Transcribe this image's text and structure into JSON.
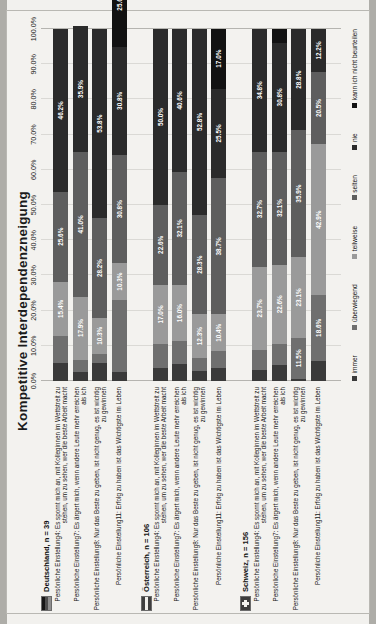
{
  "chart_data": {
    "type": "bar",
    "orientation": "horizontal-stacked",
    "title": "Kompetitive Interdependenzneigung",
    "xlabel": "",
    "ylabel": "",
    "xlim": [
      0,
      100
    ],
    "grid": true,
    "legend_position": "bottom",
    "axis_ticks": [
      "0.0%",
      "10.0%",
      "20.0%",
      "30.0%",
      "40.0%",
      "50.0%",
      "60.0%",
      "70.0%",
      "80.0%",
      "90.0%",
      "100.0%"
    ],
    "series": [
      {
        "name": "immer",
        "color": "#3a3a3a"
      },
      {
        "name": "überwiegend",
        "color": "#6f6f6f"
      },
      {
        "name": "teilweise",
        "color": "#9a9a9a"
      },
      {
        "name": "selten",
        "color": "#5e5e5e"
      },
      {
        "name": "nie",
        "color": "#2b2b2b"
      },
      {
        "name": "kann ich nicht beurteilen",
        "color": "#121212"
      }
    ],
    "groups": [
      {
        "name": "Deutschland, n = 39",
        "flag": "de",
        "rows": [
          {
            "label": "Persönliche Einstellung4: Es spornt mich an, mit Kolleginnen im Wettstreit zu stehen, um zu sehen, wer die beste Arbeit macht",
            "values": [
              5.1,
              7.7,
              15.4,
              25.6,
              46.2,
              0.0
            ],
            "labels": [
              "",
              "",
              "15.4%",
              "25.6%",
              "46.2%",
              ""
            ]
          },
          {
            "label": "Persönliche Einstellung7: Es ärgert mich, wenn andere Leute mehr erreichen als ich",
            "values": [
              2.6,
              3.5,
              17.9,
              41.0,
              35.9,
              0.0
            ],
            "labels": [
              "",
              "",
              "17.9%",
              "41.0%",
              "35.9%",
              ""
            ]
          },
          {
            "label": "Persönliche Einstellung8: Nur das Beste zu geben, ist nicht genug, es ist wichtig zu gewinnen",
            "values": [
              5.1,
              2.6,
              10.3,
              28.2,
              53.8,
              0.0
            ],
            "labels": [
              "",
              "",
              "10.3%",
              "28.2%",
              "53.8%",
              ""
            ]
          },
          {
            "label": "Persönliche Einstellung11: Erfolg zu haben ist das Wichtigste im Leben",
            "values": [
              2.6,
              20.5,
              10.3,
              30.8,
              30.8,
              25.6
            ],
            "labels": [
              "",
              "",
              "10.3%",
              "30.8%",
              "30.8%",
              "25.6%"
            ]
          }
        ]
      },
      {
        "name": "Österreich, n = 106",
        "flag": "at",
        "rows": [
          {
            "label": "Persönliche Einstellung4: Es spornt mich an, mit Kolleginnen im Wettstreit zu stehen, um zu sehen, wer die beste Arbeit macht",
            "values": [
              3.8,
              6.6,
              17.0,
              22.6,
              50.0,
              0.0
            ],
            "labels": [
              "",
              "",
              "17.0%",
              "22.6%",
              "50.0%",
              ""
            ]
          },
          {
            "label": "Persönliche Einstellung7: Es ärgert mich, wenn andere Leute mehr erreichen als ich",
            "values": [
              4.7,
              6.6,
              16.0,
              32.1,
              40.6,
              0.0
            ],
            "labels": [
              "",
              "",
              "16.0%",
              "32.1%",
              "40.6%",
              ""
            ]
          },
          {
            "label": "Persönliche Einstellung8: Nur das Beste zu geben, ist nicht genug, es ist wichtig zu gewinnen",
            "values": [
              2.8,
              3.8,
              12.3,
              28.3,
              52.8,
              0.0
            ],
            "labels": [
              "",
              "",
              "12.3%",
              "28.3%",
              "52.8%",
              ""
            ]
          },
          {
            "label": "Persönliche Einstellung11: Erfolg zu haben ist das Wichtigste im Leben",
            "values": [
              3.8,
              4.7,
              10.4,
              38.7,
              25.5,
              17.0
            ],
            "labels": [
              "",
              "",
              "10.4%",
              "38.7%",
              "25.5%",
              "17.0%"
            ]
          }
        ]
      },
      {
        "name": "Schweiz, n = 156",
        "flag": "ch",
        "rows": [
          {
            "label": "Persönliche Einstellung4: Es spornt mich an, mit Kolleginnen im Wettstreit zu stehen, um zu sehen, wer die beste Arbeit macht",
            "values": [
              3.2,
              5.6,
              23.7,
              32.7,
              34.8,
              0.0
            ],
            "labels": [
              "",
              "",
              "23.7%",
              "32.7%",
              "34.8%",
              ""
            ]
          },
          {
            "label": "Persönliche Einstellung7: Es ärgert mich, wenn andere Leute mehr erreichen als ich",
            "values": [
              4.5,
              6.0,
              22.6,
              32.1,
              30.8,
              4.0
            ],
            "labels": [
              "",
              "",
              "22.6%",
              "32.1%",
              "30.8%",
              ""
            ]
          },
          {
            "label": "Persönliche Einstellung8: Nur das Beste zu geben, ist nicht genug, es ist wichtig zu gewinnen",
            "values": [
              0.7,
              11.5,
              23.1,
              35.9,
              28.8,
              0.0
            ],
            "labels": [
              "",
              "11.5%",
              "23.1%",
              "35.9%",
              "28.8%",
              ""
            ]
          },
          {
            "label": "Persönliche Einstellung11: Erfolg zu haben ist das Wichtigste im Leben",
            "values": [
              5.8,
              18.6,
              42.9,
              20.5,
              12.2,
              0.0
            ],
            "labels": [
              "",
              "18.6%",
              "42.9%",
              "20.5%",
              "12.2%",
              ""
            ]
          }
        ]
      }
    ]
  }
}
